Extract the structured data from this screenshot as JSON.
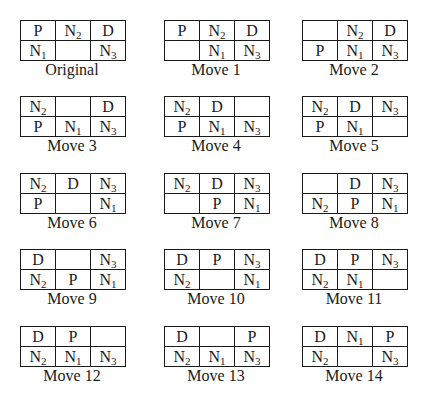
{
  "diagram": {
    "grid_rows": 2,
    "grid_cols": 3,
    "panels": [
      {
        "label": "Original",
        "cells": [
          [
            "P",
            "N2",
            "D"
          ],
          [
            "N1",
            "",
            "N3"
          ]
        ]
      },
      {
        "label": "Move 1",
        "cells": [
          [
            "P",
            "N2",
            "D"
          ],
          [
            "",
            "N1",
            "N3"
          ]
        ]
      },
      {
        "label": "Move 2",
        "cells": [
          [
            "",
            "N2",
            "D"
          ],
          [
            "P",
            "N1",
            "N3"
          ]
        ]
      },
      {
        "label": "Move 3",
        "cells": [
          [
            "N2",
            "",
            "D"
          ],
          [
            "P",
            "N1",
            "N3"
          ]
        ]
      },
      {
        "label": "Move 4",
        "cells": [
          [
            "N2",
            "D",
            ""
          ],
          [
            "P",
            "N1",
            "N3"
          ]
        ]
      },
      {
        "label": "Move 5",
        "cells": [
          [
            "N2",
            "D",
            "N3"
          ],
          [
            "P",
            "N1",
            ""
          ]
        ]
      },
      {
        "label": "Move 6",
        "cells": [
          [
            "N2",
            "D",
            "N3"
          ],
          [
            "P",
            "",
            "N1"
          ]
        ]
      },
      {
        "label": "Move 7",
        "cells": [
          [
            "N2",
            "D",
            "N3"
          ],
          [
            "",
            "P",
            "N1"
          ]
        ]
      },
      {
        "label": "Move 8",
        "cells": [
          [
            "",
            "D",
            "N3"
          ],
          [
            "N2",
            "P",
            "N1"
          ]
        ]
      },
      {
        "label": "Move 9",
        "cells": [
          [
            "D",
            "",
            "N3"
          ],
          [
            "N2",
            "P",
            "N1"
          ]
        ]
      },
      {
        "label": "Move 10",
        "cells": [
          [
            "D",
            "P",
            "N3"
          ],
          [
            "N2",
            "",
            "N1"
          ]
        ]
      },
      {
        "label": "Move 11",
        "cells": [
          [
            "D",
            "P",
            "N3"
          ],
          [
            "N2",
            "N1",
            ""
          ]
        ]
      },
      {
        "label": "Move 12",
        "cells": [
          [
            "D",
            "P",
            ""
          ],
          [
            "N2",
            "N1",
            "N3"
          ]
        ]
      },
      {
        "label": "Move 13",
        "cells": [
          [
            "D",
            "",
            "P"
          ],
          [
            "N2",
            "N1",
            "N3"
          ]
        ]
      },
      {
        "label": "Move 14",
        "cells": [
          [
            "D",
            "N1",
            "P"
          ],
          [
            "N2",
            "",
            "N3"
          ]
        ]
      }
    ]
  },
  "layout": {
    "columns_x": [
      20,
      164,
      302
    ],
    "rows_y": [
      20,
      96,
      173,
      249,
      326
    ]
  }
}
